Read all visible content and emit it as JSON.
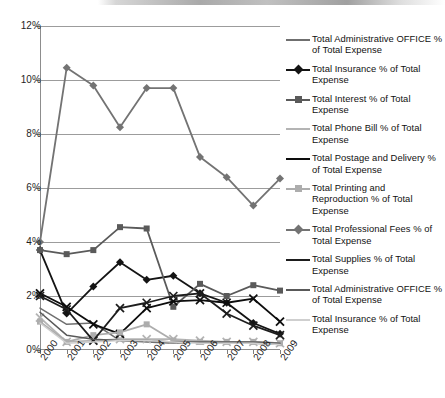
{
  "chart_data": {
    "type": "line",
    "title": "",
    "xlabel": "",
    "ylabel": "",
    "categories": [
      "2000",
      "2001",
      "2002",
      "2003",
      "2004",
      "2005",
      "2006",
      "2007",
      "2008",
      "2009"
    ],
    "ylim": [
      0,
      12
    ],
    "ytick_labels": [
      "0%",
      "2%",
      "4%",
      "6%",
      "8%",
      "10%",
      "12%"
    ],
    "ytick_values": [
      0,
      2,
      4,
      6,
      8,
      10,
      12
    ],
    "grid": true,
    "legend_position": "right",
    "series": [
      {
        "name": "Total Administrative OFFICE  % of Total Expense",
        "color": "#6f6f6f",
        "marker": "none",
        "values": [
          1.55,
          0.95,
          1.0,
          0.35,
          0.3,
          0.25,
          0.3,
          0.3,
          0.25,
          0.2
        ]
      },
      {
        "name": "Total Insurance  % of Total Expense",
        "color": "#141414",
        "marker": "diamond",
        "values": [
          3.7,
          1.35,
          2.35,
          3.25,
          2.6,
          2.75,
          2.1,
          1.75,
          1.0,
          0.6
        ]
      },
      {
        "name": "Total Interest  % of Total Expense",
        "color": "#5a5a5a",
        "marker": "square",
        "values": [
          3.7,
          3.55,
          3.7,
          4.55,
          4.5,
          1.6,
          2.45,
          2.0,
          2.4,
          2.2
        ]
      },
      {
        "name": "Total Phone Bill  % of Total Expense",
        "color": "#b4b4b4",
        "marker": "cross",
        "values": [
          1.2,
          0.3,
          0.35,
          0.4,
          0.4,
          0.4,
          0.35,
          0.3,
          0.3,
          0.25
        ]
      },
      {
        "name": "Total Postage and Delivery  % of Total Expense",
        "color": "#0d0d0d",
        "marker": "cross",
        "values": [
          2.1,
          1.6,
          0.95,
          0.6,
          1.55,
          1.8,
          1.85,
          1.75,
          1.9,
          1.05
        ]
      },
      {
        "name": "Total Printing and Reproduction  % of Total Expense",
        "color": "#adadad",
        "marker": "square",
        "values": [
          1.05,
          0.3,
          0.55,
          0.65,
          0.95,
          0.35,
          0.3,
          0.3,
          0.3,
          0.25
        ]
      },
      {
        "name": "Total Professional Fees  % of Total Expense",
        "color": "#737373",
        "marker": "diamond",
        "values": [
          4.0,
          10.45,
          9.8,
          8.25,
          9.7,
          9.7,
          7.15,
          6.4,
          5.35,
          6.35
        ]
      },
      {
        "name": "Total Supplies  % of Total Expense",
        "color": "#1d1d1d",
        "marker": "cross",
        "values": [
          2.0,
          1.5,
          0.35,
          1.55,
          1.75,
          2.0,
          2.1,
          1.35,
          0.9,
          0.55
        ]
      },
      {
        "name": "Total Administrative OFFICE  % of Total Expense",
        "color": "#595959",
        "marker": "none",
        "values": [
          1.4,
          0.55,
          0.4,
          0.35,
          0.35,
          0.3,
          0.3,
          0.3,
          0.3,
          0.25
        ]
      },
      {
        "name": "Total Insurance  % of Total Expense",
        "color": "#cfcfcf",
        "marker": "none",
        "values": [
          1.0,
          0.25,
          0.3,
          0.35,
          0.35,
          0.3,
          0.25,
          0.25,
          0.25,
          0.2
        ]
      }
    ]
  },
  "legend": {
    "items": [
      {
        "label": "Total Administrative OFFICE  % of Total Expense",
        "color": "#6f6f6f",
        "marker": "none"
      },
      {
        "label": "Total Insurance  % of Total Expense",
        "color": "#141414",
        "marker": "diamond"
      },
      {
        "label": "Total Interest  % of Total Expense",
        "color": "#5a5a5a",
        "marker": "square"
      },
      {
        "label": "Total Phone Bill  % of Total Expense",
        "color": "#b4b4b4",
        "marker": "cross"
      },
      {
        "label": "Total Postage and Delivery  % of Total Expense",
        "color": "#0d0d0d",
        "marker": "cross"
      },
      {
        "label": "Total Printing and Reproduction  % of Total Expense",
        "color": "#adadad",
        "marker": "square"
      },
      {
        "label": "Total Professional Fees  % of Total Expense",
        "color": "#737373",
        "marker": "diamond"
      },
      {
        "label": "Total Supplies  % of Total Expense",
        "color": "#1d1d1d",
        "marker": "cross"
      },
      {
        "label": "Total Administrative OFFICE  % of Total Expense",
        "color": "#595959",
        "marker": "none"
      },
      {
        "label": "Total Insurance  % of Total Expense",
        "color": "#cfcfcf",
        "marker": "none"
      }
    ]
  }
}
